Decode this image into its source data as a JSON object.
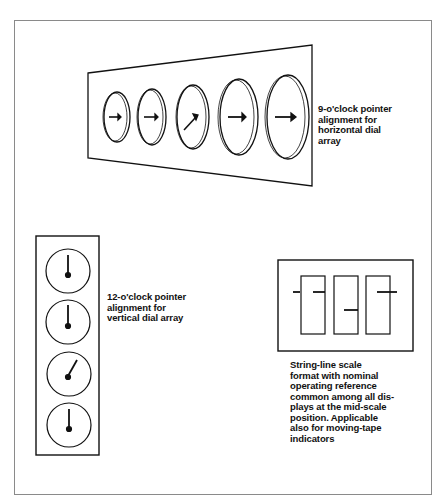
{
  "figure": {
    "panels": [
      {
        "id": "horizontal",
        "caption": "9-o'clock pointer\nalignment for\nhorizontal dial\narray",
        "dial_count": 5,
        "reference_position": "9 o'clock",
        "deviating_dial_index": 2
      },
      {
        "id": "vertical",
        "caption": "12-o'clock pointer\nalignment for\nvertical dial array",
        "dial_count": 4,
        "reference_position": "12 o'clock",
        "deviating_dial_index": 2
      },
      {
        "id": "string-line",
        "caption": "String-line scale\nformat with nominal\noperating reference\ncommon among all dis-\nplays at the mid-scale\nposition. Applicable\nalso for moving-tape\nindicators",
        "tape_count": 3,
        "reference_position": "mid-scale",
        "deviating_tape_index": 1
      }
    ],
    "colors": {
      "ink": "#111111",
      "frame": "#8a8a8a",
      "background": "#ffffff"
    }
  }
}
